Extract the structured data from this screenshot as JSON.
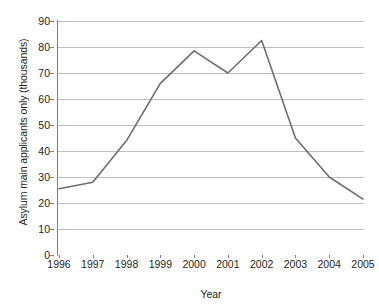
{
  "chart_data": {
    "type": "line",
    "title": "",
    "xlabel": "Year",
    "ylabel": "Asylum main applicants only (thousands)",
    "categories": [
      1996,
      1997,
      1998,
      1999,
      2000,
      2001,
      2002,
      2003,
      2004,
      2005
    ],
    "x_tick_labels": [
      "1996",
      "1997",
      "1998",
      "1999",
      "2000",
      "2001",
      "2002",
      "2003",
      "2004",
      "2005"
    ],
    "values": [
      25.5,
      28,
      44,
      66,
      78.5,
      70,
      82.5,
      45,
      30,
      21.5
    ],
    "series": [
      {
        "name": "Asylum main applicants only (thousands)",
        "values": [
          25.5,
          28,
          44,
          66,
          78.5,
          70,
          82.5,
          45,
          30,
          21.5
        ],
        "color": "#6e6e6e"
      }
    ],
    "ylim": [
      0,
      90
    ],
    "y_tick_labels": [
      "0",
      "10",
      "20",
      "30",
      "40",
      "50",
      "60",
      "70",
      "80",
      "90"
    ],
    "y_ticks": [
      0,
      10,
      20,
      30,
      40,
      50,
      60,
      70,
      80,
      90
    ],
    "xlim": [
      1996,
      2005
    ],
    "grid": "horizontal",
    "legend": "none",
    "line_color": "#6e6e6e",
    "grid_color": "#bfbfbf",
    "axis_color": "#808080",
    "background": "#ffffff"
  }
}
